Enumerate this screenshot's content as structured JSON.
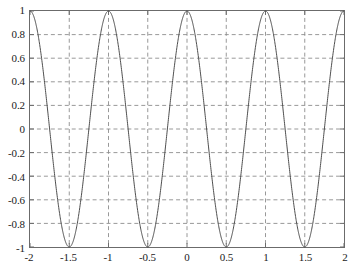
{
  "chart_data": {
    "type": "line",
    "title": "",
    "subtitle": "",
    "xlabel": "",
    "ylabel": "",
    "xlim": [
      -2,
      2
    ],
    "ylim": [
      -1,
      1
    ],
    "grid": true,
    "grid_style": "dashed",
    "grid_color": "#8c8c8c",
    "legend": null,
    "legend_position": "none",
    "annotations": [],
    "xticks": [
      -2,
      -1.5,
      -1,
      -0.5,
      0,
      0.5,
      1,
      1.5,
      2
    ],
    "xtick_labels": [
      "-2",
      "-1.5",
      "-1",
      "-0.5",
      "0",
      "0.5",
      "1",
      "1.5",
      "2"
    ],
    "yticks": [
      -1,
      -0.8,
      -0.6,
      -0.4,
      -0.2,
      0,
      0.2,
      0.4,
      0.6,
      0.8,
      1
    ],
    "ytick_labels": [
      "-1",
      "-0.8",
      "-0.6",
      "-0.4",
      "-0.2",
      "0",
      "0.2",
      "0.4",
      "0.6",
      "0.8",
      "1"
    ],
    "series": [
      {
        "name": "cos(2*pi*x)",
        "color": "#4d4d4d",
        "line_width": 1,
        "expression": "cos(2*pi*x)",
        "period": 1,
        "amplitude": 1,
        "peaks_x": [
          -2,
          -1,
          0,
          1,
          2
        ],
        "troughs_x": [
          -1.5,
          -0.5,
          0.5,
          1.5
        ],
        "x": [
          -2,
          -1.95,
          -1.9,
          -1.85,
          -1.8,
          -1.75,
          -1.7,
          -1.65,
          -1.6,
          -1.55,
          -1.5,
          -1.45,
          -1.4,
          -1.35,
          -1.3,
          -1.25,
          -1.2,
          -1.15,
          -1.1,
          -1.05,
          -1,
          -0.95,
          -0.9,
          -0.85,
          -0.8,
          -0.75,
          -0.7,
          -0.65,
          -0.6,
          -0.55,
          -0.5,
          -0.45,
          -0.4,
          -0.35,
          -0.3,
          -0.25,
          -0.2,
          -0.15,
          -0.1,
          -0.05,
          0,
          0.05,
          0.1,
          0.15,
          0.2,
          0.25,
          0.3,
          0.35,
          0.4,
          0.45,
          0.5,
          0.55,
          0.6,
          0.65,
          0.7,
          0.75,
          0.8,
          0.85,
          0.9,
          0.95,
          1,
          1.05,
          1.1,
          1.15,
          1.2,
          1.25,
          1.3,
          1.35,
          1.4,
          1.45,
          1.5,
          1.55,
          1.6,
          1.65,
          1.7,
          1.75,
          1.8,
          1.85,
          1.9,
          1.95,
          2
        ],
        "y": [
          1,
          0.951,
          0.809,
          0.588,
          0.309,
          0,
          -0.309,
          -0.588,
          -0.809,
          -0.951,
          -1,
          -0.951,
          -0.809,
          -0.588,
          -0.309,
          0,
          0.309,
          0.588,
          0.809,
          0.951,
          1,
          0.951,
          0.809,
          0.588,
          0.309,
          0,
          -0.309,
          -0.588,
          -0.809,
          -0.951,
          -1,
          -0.951,
          -0.809,
          -0.588,
          -0.309,
          0,
          0.309,
          0.588,
          0.809,
          0.951,
          1,
          0.951,
          0.809,
          0.588,
          0.309,
          0,
          -0.309,
          -0.588,
          -0.809,
          -0.951,
          -1,
          -0.951,
          -0.809,
          -0.588,
          -0.309,
          0,
          0.309,
          0.588,
          0.809,
          0.951,
          1,
          0.951,
          0.809,
          0.588,
          0.309,
          0,
          -0.309,
          -0.588,
          -0.809,
          -0.951,
          -1,
          -0.951,
          -0.809,
          -0.588,
          -0.309,
          0,
          0.309,
          0.588,
          0.809,
          0.951,
          1
        ]
      }
    ]
  }
}
